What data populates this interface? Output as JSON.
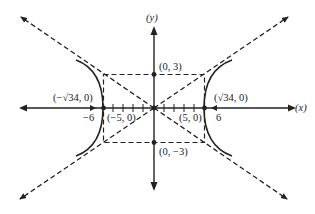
{
  "diagram": {
    "type": "hyperbola-graph",
    "colors": {
      "ink": "#222222",
      "background": "#ffffff"
    },
    "axes": {
      "x_label": "(x)",
      "y_label": "(y)"
    },
    "labels": {
      "vertex_left": "(−√34, 0)",
      "vertex_right": "(√34, 0)",
      "tick_neg6": "−6",
      "tick_pos6": "6",
      "point_neg5": "(−5, 0)",
      "point_pos5": "(5, 0)",
      "point_top": "(0, 3)",
      "point_bottom": "(0, −3)"
    },
    "elements": {
      "curve": "hyperbola x²/25 − y²/9 = 1 (two branches)",
      "asymptotes": [
        "y = 3x/5",
        "y = −3x/5"
      ],
      "fundamental_rectangle": {
        "x": [
          -5,
          5
        ],
        "y": [
          -3,
          3
        ]
      },
      "tick_marks_x": [
        -4,
        -3,
        -2,
        -1,
        1,
        2,
        3,
        4
      ]
    }
  }
}
